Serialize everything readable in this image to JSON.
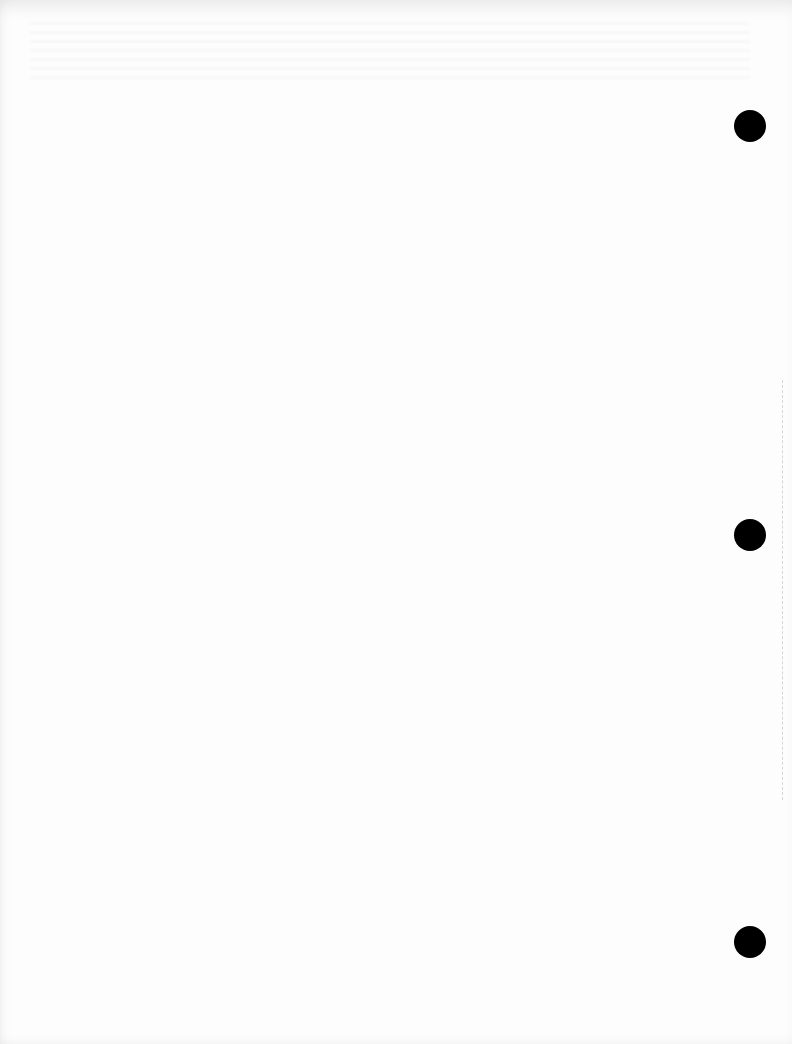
{
  "page": {
    "type": "scanned blank page",
    "background_color": "#fdfdfd",
    "punch_holes": [
      {
        "x": 750,
        "y": 126,
        "diameter": 32,
        "color": "#000000"
      },
      {
        "x": 750,
        "y": 535,
        "diameter": 32,
        "color": "#000000"
      },
      {
        "x": 750,
        "y": 942,
        "diameter": 32,
        "color": "#000000"
      }
    ]
  }
}
